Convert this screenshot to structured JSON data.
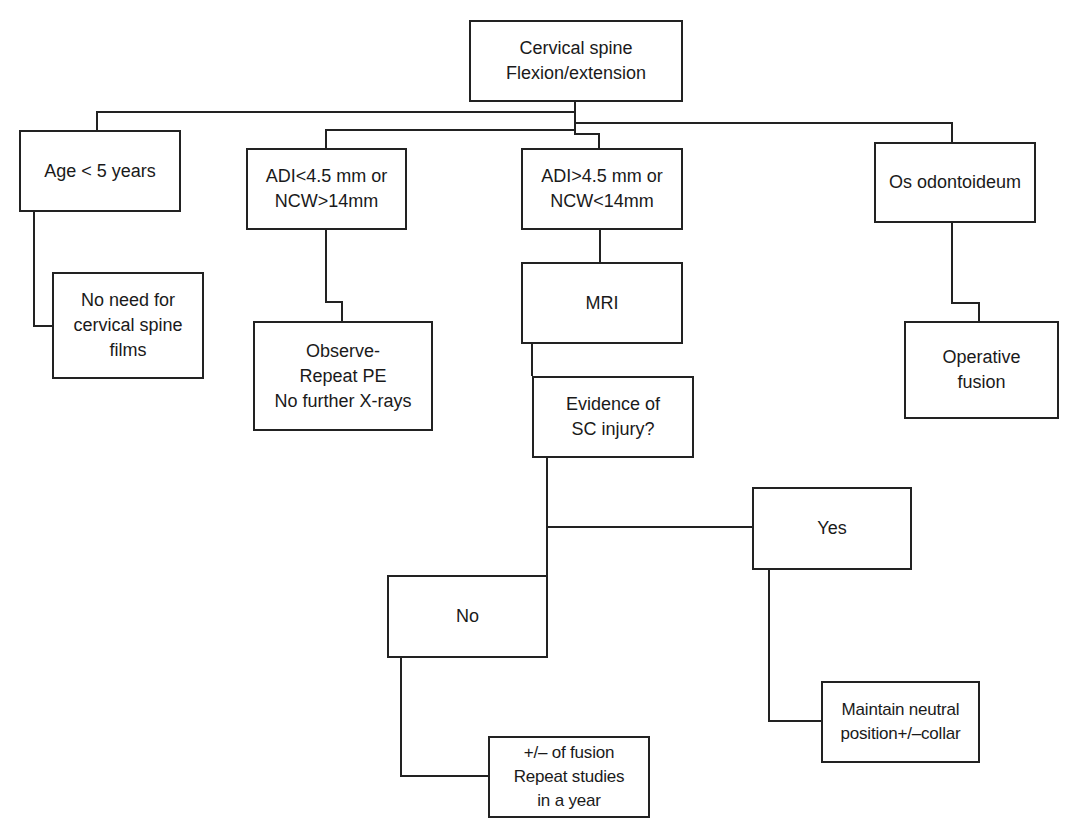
{
  "diagram": {
    "type": "flowchart",
    "nodes": {
      "root": {
        "lines": [
          "Cervical spine",
          "Flexion/extension"
        ]
      },
      "age": {
        "lines": [
          "Age < 5 years"
        ]
      },
      "no_need": {
        "lines": [
          "No need for",
          "cervical spine",
          "films"
        ]
      },
      "adi_low": {
        "lines": [
          "ADI<4.5 mm or",
          "NCW>14mm"
        ]
      },
      "observe": {
        "lines": [
          "Observe-",
          "Repeat PE",
          "No further X-rays"
        ]
      },
      "adi_high": {
        "lines": [
          "ADI>4.5 mm or",
          "NCW<14mm"
        ]
      },
      "mri": {
        "lines": [
          "MRI"
        ]
      },
      "evidence": {
        "lines": [
          "Evidence of",
          "SC injury?"
        ]
      },
      "no": {
        "lines": [
          "No"
        ]
      },
      "fusion_rep": {
        "lines": [
          "+/– of fusion",
          "Repeat studies",
          "in a year"
        ]
      },
      "yes": {
        "lines": [
          "Yes"
        ]
      },
      "maintain": {
        "lines": [
          "Maintain neutral",
          "position+/–collar"
        ]
      },
      "os": {
        "lines": [
          "Os odontoideum"
        ]
      },
      "operative": {
        "lines": [
          "Operative",
          "fusion"
        ]
      }
    },
    "edges": [
      {
        "from": "root",
        "to": "age"
      },
      {
        "from": "root",
        "to": "adi_low"
      },
      {
        "from": "root",
        "to": "adi_high"
      },
      {
        "from": "root",
        "to": "os"
      },
      {
        "from": "age",
        "to": "no_need"
      },
      {
        "from": "adi_low",
        "to": "observe"
      },
      {
        "from": "adi_high",
        "to": "mri"
      },
      {
        "from": "mri",
        "to": "evidence"
      },
      {
        "from": "evidence",
        "to": "yes"
      },
      {
        "from": "evidence",
        "to": "no"
      },
      {
        "from": "no",
        "to": "fusion_rep"
      },
      {
        "from": "yes",
        "to": "maintain"
      },
      {
        "from": "os",
        "to": "operative"
      }
    ],
    "colors": {
      "line": "#222222",
      "box_fill": "#ffffff",
      "text": "#1a1a1a"
    }
  }
}
